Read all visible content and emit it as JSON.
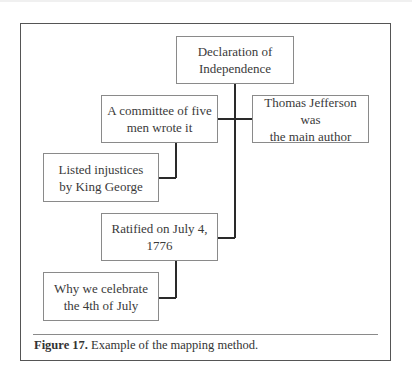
{
  "diagram": {
    "nodes": [
      {
        "id": "root",
        "label": "Declaration of Independence",
        "lines": [
          "Declaration of",
          "Independence"
        ]
      },
      {
        "id": "committee",
        "label": "A committee of five men wrote it",
        "lines": [
          "A committee of five",
          "men wrote it"
        ]
      },
      {
        "id": "jefferson",
        "label": "Thomas Jefferson was the main author",
        "lines": [
          "Thomas Jefferson was",
          "the main author"
        ]
      },
      {
        "id": "injustices",
        "label": "Listed injustices by King George",
        "lines": [
          "Listed injustices",
          "by King George"
        ]
      },
      {
        "id": "ratified",
        "label": "Ratified on July 4, 1776",
        "lines": [
          "Ratified on July 4, 1776"
        ]
      },
      {
        "id": "celebrate",
        "label": "Why we celebrate the 4th of July",
        "lines": [
          "Why we celebrate",
          "the 4th of July"
        ]
      }
    ],
    "edges": [
      {
        "from": "root",
        "to": "committee"
      },
      {
        "from": "root",
        "to": "jefferson"
      },
      {
        "from": "root",
        "to": "ratified"
      },
      {
        "from": "committee",
        "to": "injustices"
      },
      {
        "from": "ratified",
        "to": "celebrate"
      }
    ]
  },
  "caption": {
    "label": "Figure 17.",
    "text": " Example of the mapping method."
  }
}
